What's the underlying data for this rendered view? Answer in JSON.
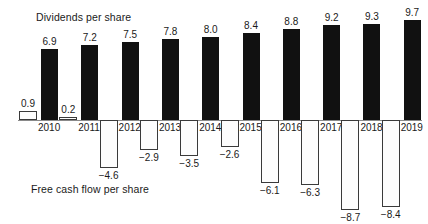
{
  "figure": {
    "dividends_title": "Dividends per share",
    "fcf_title": "Free cash flow per share"
  },
  "chart_data": {
    "type": "bar",
    "title": "Dividends per share",
    "subtitle": "Free cash flow per share",
    "xlabel": "",
    "ylabel": "",
    "grid": false,
    "legend": "none",
    "orientation": "vertical",
    "baseline": 0,
    "ylim": [
      -9.5,
      10.5
    ],
    "categories": [
      "2010",
      "2011",
      "2012",
      "2013",
      "2014",
      "2015",
      "2016",
      "2017",
      "2018",
      "2019"
    ],
    "series": [
      {
        "name": "Free cash flow per share",
        "style": "stippled",
        "values": [
          0.9,
          0.2,
          -4.6,
          -2.9,
          -3.5,
          -2.6,
          -6.1,
          -6.3,
          -8.7,
          -8.4
        ],
        "labels": [
          "0.9",
          "0.2",
          "−4.6",
          "−2.9",
          "−3.5",
          "−2.6",
          "−6.1",
          "−6.3",
          "−8.7",
          "−8.4"
        ]
      },
      {
        "name": "Dividends per share",
        "style": "solid-black",
        "values": [
          6.9,
          7.2,
          7.5,
          7.8,
          8.0,
          8.4,
          8.8,
          9.2,
          9.3,
          9.7
        ],
        "labels": [
          "6.9",
          "7.2",
          "7.5",
          "7.8",
          "8.0",
          "8.4",
          "8.8",
          "9.2",
          "9.3",
          "9.7"
        ]
      }
    ],
    "colors": {
      "dividend_bar": "#111111",
      "fcf_bar_fill": "#fdfdfd",
      "fcf_bar_dots": "#b9b9b9",
      "fcf_bar_border": "#3a3a3a",
      "axis": "#8a8a8a",
      "text": "#1a1a1a"
    }
  }
}
